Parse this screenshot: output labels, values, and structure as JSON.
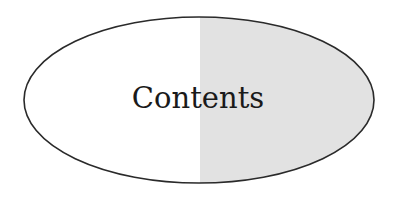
{
  "diagram": {
    "shape": "ellipse",
    "label": "Contents",
    "colors": {
      "left_fill": "#ffffff",
      "right_fill": "#e2e2e2",
      "stroke": "#2a2a2a",
      "text": "#1a1a1a"
    }
  }
}
